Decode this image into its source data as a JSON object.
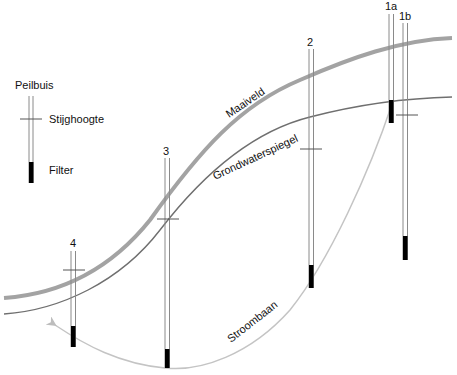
{
  "legend": {
    "peilbuis_label": "Peilbuis",
    "stijghoogte_label": "Stijghoogte",
    "filter_label": "Filter"
  },
  "curves": {
    "maaiveld_label": "Maaiveld",
    "grondwaterspiegel_label": "Grondwaterspiegel",
    "stroombaan_label": "Stroombaan"
  },
  "colors": {
    "maaiveld": "#a3a3a3",
    "grondwaterspiegel": "#6f6f6f",
    "stroombaan": "#c4c4c4",
    "tube": "#8a8a8a",
    "filter": "#000000"
  },
  "peilbuizen": [
    {
      "id": "4",
      "label": "4"
    },
    {
      "id": "3",
      "label": "3"
    },
    {
      "id": "2",
      "label": "2"
    },
    {
      "id": "1a",
      "label": "1a"
    },
    {
      "id": "1b",
      "label": "1b"
    }
  ]
}
